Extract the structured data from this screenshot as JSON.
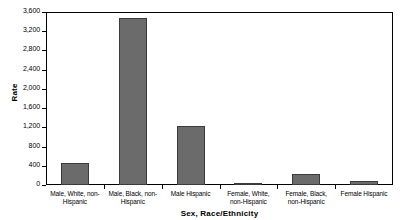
{
  "chart_data": {
    "type": "bar",
    "title": "",
    "xlabel": "Sex, Race/Ethnicity",
    "ylabel": "Rate",
    "categories": [
      "Male, White, non-Hispanic",
      "Male, Black, non-Hispanic",
      "Male Hispanic",
      "Female, White, non-Hispanic",
      "Female, Black, non-Hispanic",
      "Female Hispanic"
    ],
    "values": [
      450,
      3470,
      1220,
      45,
      230,
      85
    ],
    "ylim": [
      0,
      3600
    ],
    "ytick_labels": [
      "0",
      "400",
      "800",
      "1,200",
      "1,600",
      "2,000",
      "2,400",
      "2,800",
      "3,200",
      "3,600"
    ],
    "ytick_values": [
      0,
      400,
      800,
      1200,
      1600,
      2000,
      2400,
      2800,
      3200,
      3600
    ],
    "grid": false,
    "legend": "none",
    "bar_color": "#6b6b6b",
    "bar_border_color": "#3a3a3a",
    "axis_color": "#000000"
  }
}
